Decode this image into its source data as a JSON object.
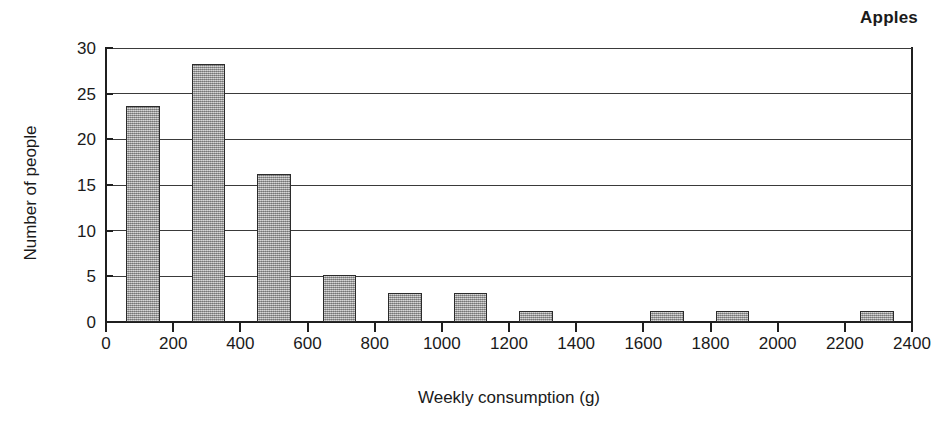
{
  "chart_data": {
    "type": "bar",
    "title": "Apples",
    "xlabel": "Weekly consumption (g)",
    "ylabel": "Number of people",
    "grid": "horizontal",
    "legend": "none",
    "xlim": [
      0,
      2400
    ],
    "ylim": [
      0,
      30
    ],
    "x_tick_labels": [
      "0",
      "200",
      "400",
      "600",
      "800",
      "1000",
      "1200",
      "1400",
      "1600",
      "1800",
      "2000",
      "2200",
      "2400"
    ],
    "x_tick_values": [
      0,
      200,
      400,
      600,
      800,
      1000,
      1200,
      1400,
      1600,
      1800,
      2000,
      2200,
      2400
    ],
    "y_tick_labels": [
      "0",
      "5",
      "10",
      "15",
      "20",
      "25",
      "30"
    ],
    "y_tick_values": [
      0,
      5,
      10,
      15,
      20,
      25,
      30
    ],
    "bin_width": 200,
    "bars": [
      {
        "bin_start": 0,
        "bin_end": 200,
        "bin_label": "0-200",
        "bar_left": 60,
        "bar_right": 160,
        "value": 23.7
      },
      {
        "bin_start": 200,
        "bin_end": 400,
        "bin_label": "200-400",
        "bar_left": 255,
        "bar_right": 355,
        "value": 28.3
      },
      {
        "bin_start": 400,
        "bin_end": 600,
        "bin_label": "400-600",
        "bar_left": 450,
        "bar_right": 550,
        "value": 16.2
      },
      {
        "bin_start": 600,
        "bin_end": 800,
        "bin_label": "600-800",
        "bar_left": 645,
        "bar_right": 745,
        "value": 5.2
      },
      {
        "bin_start": 800,
        "bin_end": 1000,
        "bin_label": "800-1000",
        "bar_left": 840,
        "bar_right": 940,
        "value": 3.2
      },
      {
        "bin_start": 1000,
        "bin_end": 1200,
        "bin_label": "1000-1200",
        "bar_left": 1035,
        "bar_right": 1135,
        "value": 3.2
      },
      {
        "bin_start": 1200,
        "bin_end": 1400,
        "bin_label": "1200-1400",
        "bar_left": 1230,
        "bar_right": 1330,
        "value": 1.2
      },
      {
        "bin_start": 1600,
        "bin_end": 1800,
        "bin_label": "1600-1800",
        "bar_left": 1620,
        "bar_right": 1720,
        "value": 1.2
      },
      {
        "bin_start": 1800,
        "bin_end": 2000,
        "bin_label": "1800-2000",
        "bar_left": 1815,
        "bar_right": 1915,
        "value": 1.2
      },
      {
        "bin_start": 2200,
        "bin_end": 2400,
        "bin_label": "2200-2400",
        "bar_left": 2245,
        "bar_right": 2345,
        "value": 1.2
      }
    ],
    "colors": {
      "bar_fill": "#9e9e9e",
      "bar_edge": "#2b2b2b",
      "axis": "#1f1f1f",
      "grid": "#3a3a3a",
      "text": "#1a1a1a",
      "background": "#ffffff"
    }
  }
}
